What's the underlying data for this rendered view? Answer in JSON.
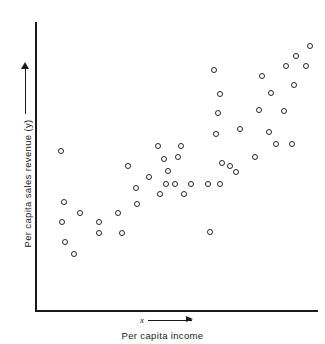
{
  "figure": {
    "background_color": "#ffffff",
    "ink_color": "#1a1a1a",
    "marker_color": "#23232b"
  },
  "axes": {
    "y_axis_label": "Per capita sales revenue (y)",
    "y_axis_arrow": "up-arrow",
    "x_axis_label": "Per capita income",
    "x_axis_variable": "x",
    "x_axis_arrow": "right-arrow"
  },
  "chart_data": {
    "type": "scatter",
    "title": "",
    "xlabel": "Per capita income",
    "ylabel": "Per capita sales revenue (y)",
    "xvar": "x",
    "yvar": "y",
    "grid": false,
    "legend": "none",
    "axis_ticks": false,
    "axis_tick_labels": false,
    "xlim": [
      0,
      100
    ],
    "ylim": [
      0,
      100
    ],
    "n_points": 48,
    "relationship": "positive linear correlation",
    "points": [
      {
        "x": 8.9,
        "y": 56.5
      },
      {
        "x": 10.0,
        "y": 38.4
      },
      {
        "x": 15.7,
        "y": 34.6
      },
      {
        "x": 9.2,
        "y": 31.5
      },
      {
        "x": 10.4,
        "y": 24.5
      },
      {
        "x": 13.5,
        "y": 20.3
      },
      {
        "x": 22.4,
        "y": 27.6
      },
      {
        "x": 29.1,
        "y": 34.6
      },
      {
        "x": 22.4,
        "y": 31.5
      },
      {
        "x": 30.5,
        "y": 27.6
      },
      {
        "x": 35.5,
        "y": 43.6
      },
      {
        "x": 35.9,
        "y": 37.7
      },
      {
        "x": 32.6,
        "y": 51.2
      },
      {
        "x": 40.1,
        "y": 47.4
      },
      {
        "x": 43.3,
        "y": 58.2
      },
      {
        "x": 45.4,
        "y": 53.7
      },
      {
        "x": 46.8,
        "y": 49.5
      },
      {
        "x": 46.1,
        "y": 45.0
      },
      {
        "x": 49.3,
        "y": 44.7
      },
      {
        "x": 50.4,
        "y": 54.4
      },
      {
        "x": 51.4,
        "y": 58.2
      },
      {
        "x": 52.5,
        "y": 41.2
      },
      {
        "x": 55.0,
        "y": 45.0
      },
      {
        "x": 61.0,
        "y": 45.0
      },
      {
        "x": 61.7,
        "y": 28.0
      },
      {
        "x": 65.2,
        "y": 45.0
      },
      {
        "x": 66.0,
        "y": 52.4
      },
      {
        "x": 63.8,
        "y": 62.5
      },
      {
        "x": 64.5,
        "y": 70.0
      },
      {
        "x": 65.2,
        "y": 76.6
      },
      {
        "x": 63.1,
        "y": 85.0
      },
      {
        "x": 68.8,
        "y": 51.2
      },
      {
        "x": 70.9,
        "y": 49.1
      },
      {
        "x": 72.3,
        "y": 64.4
      },
      {
        "x": 77.6,
        "y": 54.4
      },
      {
        "x": 79.0,
        "y": 71.2
      },
      {
        "x": 80.1,
        "y": 82.9
      },
      {
        "x": 82.6,
        "y": 63.4
      },
      {
        "x": 83.3,
        "y": 76.9
      },
      {
        "x": 85.1,
        "y": 58.9
      },
      {
        "x": 87.9,
        "y": 70.6
      },
      {
        "x": 88.7,
        "y": 86.6
      },
      {
        "x": 90.8,
        "y": 58.9
      },
      {
        "x": 91.5,
        "y": 79.7
      },
      {
        "x": 92.2,
        "y": 90.0
      },
      {
        "x": 95.7,
        "y": 86.6
      },
      {
        "x": 97.2,
        "y": 93.7
      },
      {
        "x": 44.0,
        "y": 41.2
      }
    ]
  }
}
